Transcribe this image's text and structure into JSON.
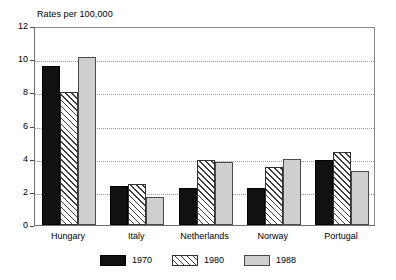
{
  "chart_data": {
    "type": "bar",
    "title": "Rates per 100,000",
    "xlabel": "",
    "ylabel": "",
    "ylim": [
      0,
      12
    ],
    "yticks": [
      0,
      2,
      4,
      6,
      8,
      10,
      12
    ],
    "grid": "horizontal-dotted",
    "legend_position": "bottom-center",
    "categories": [
      "Hungary",
      "Italy",
      "Netherlands",
      "Norway",
      "Portugal"
    ],
    "series": [
      {
        "name": "1970",
        "style": "solid-black",
        "color": "#111111",
        "values": [
          9.6,
          2.35,
          2.25,
          2.25,
          3.9
        ]
      },
      {
        "name": "1980",
        "style": "diagonal-hatch",
        "color": "#ffffff",
        "values": [
          8.0,
          2.5,
          3.9,
          3.5,
          4.4
        ]
      },
      {
        "name": "1988",
        "style": "solid-gray",
        "color": "#cfcfcf",
        "values": [
          10.15,
          1.7,
          3.8,
          4.0,
          3.25
        ]
      }
    ]
  },
  "axis": {
    "y_tick_labels": [
      "12",
      "10",
      "8",
      "6",
      "4",
      "2",
      "0"
    ]
  },
  "legend": {
    "items": [
      {
        "label": "1970"
      },
      {
        "label": "1980"
      },
      {
        "label": "1988"
      }
    ]
  }
}
